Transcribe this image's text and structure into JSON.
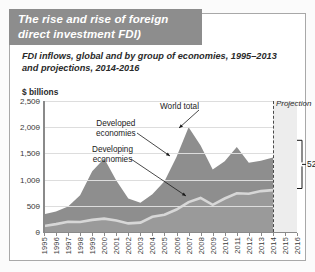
{
  "title": "The rise and rise of foreign direct investment FDI)",
  "subtitle": "FDI inflows, global and by group of economies, 1995–2013 and projections, 2014-2016",
  "unit_label": "$ billions",
  "colors": {
    "banner": "#8d8d8d",
    "developed_area": "#8e8e8e",
    "developing_area": "#9a9a9a",
    "developing_line": "#d7d7d7",
    "projection_band": "#ededed",
    "grid": "#dddddd",
    "axis": "#8a8a8a",
    "title_text": "#ffffff"
  },
  "annotations": {
    "world_total": "World total",
    "developed": "Developed\neconomies",
    "developed_line1": "Developed",
    "developed_line2": "economies",
    "developing_line1": "Developing",
    "developing_line2": "economies",
    "projection": "Projection",
    "bracket_percent": "52%"
  },
  "chart_data": {
    "type": "area",
    "stacked": true,
    "title": "The rise and rise of foreign direct investment FDI)",
    "subtitle": "FDI inflows, global and by group of economies, 1995–2013 and projections, 2014-2016",
    "xlabel": "",
    "ylabel": "$ billions",
    "ylim": [
      0,
      2500
    ],
    "yticks": [
      0,
      500,
      1000,
      1500,
      2000,
      2500
    ],
    "ytick_labels": [
      "0",
      "500",
      "1,000",
      "1,500",
      "2,000",
      "2,500"
    ],
    "grid": true,
    "legend": "annotated-inline",
    "x": [
      1995,
      1996,
      1997,
      1998,
      1999,
      2000,
      2001,
      2002,
      2003,
      2004,
      2005,
      2006,
      2007,
      2008,
      2009,
      2010,
      2011,
      2012,
      2013,
      2014,
      2015,
      2016
    ],
    "xtick_labels": [
      "1995",
      "1996",
      "1997",
      "1998",
      "1999",
      "2000",
      "2001",
      "2002",
      "2003",
      "2004",
      "2005",
      "2006",
      "2007",
      "2008",
      "2009",
      "2010",
      "2011",
      "2012",
      "2013",
      "2014",
      "2015",
      "2016"
    ],
    "projection_start": 2014,
    "projection_label": "Projection",
    "series": [
      {
        "name": "Developing economies",
        "values": [
          115,
          150,
          195,
          190,
          230,
          255,
          220,
          165,
          180,
          290,
          330,
          430,
          570,
          650,
          520,
          640,
          740,
          730,
          780,
          800,
          815,
          830
        ]
      },
      {
        "name": "Developed economies",
        "values": [
          225,
          240,
          290,
          510,
          930,
          1145,
          760,
          475,
          380,
          430,
          640,
          1000,
          1430,
          1000,
          670,
          710,
          880,
          590,
          580,
          620,
          750,
          920
        ]
      }
    ],
    "world_total": {
      "name": "World total",
      "values": [
        340,
        390,
        485,
        700,
        1160,
        1400,
        980,
        640,
        560,
        720,
        970,
        1430,
        2000,
        1650,
        1190,
        1350,
        1620,
        1320,
        1360,
        1420,
        1565,
        1750
      ]
    },
    "bracket_annotation": {
      "label": "52%",
      "from_value": 830,
      "to_value": 1750,
      "at_x": 2016,
      "meaning": "developing economies share gap at end of projection"
    }
  }
}
